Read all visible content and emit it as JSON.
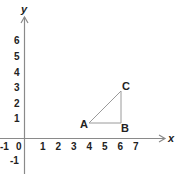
{
  "diagram": {
    "type": "coordinate-plane",
    "colors": {
      "axis": "#8a8a8a",
      "triangle": "#9a9a9a",
      "text": "#222222",
      "background": "#ffffff"
    },
    "axes": {
      "x_label": "x",
      "y_label": "y",
      "x_ticks": [
        "-1",
        "0",
        "1",
        "2",
        "3",
        "4",
        "5",
        "6",
        "7"
      ],
      "y_ticks": [
        "6",
        "5",
        "4",
        "3",
        "2",
        "1",
        "-1"
      ]
    },
    "triangle": {
      "points": [
        {
          "label": "A",
          "x": 4,
          "y": 1
        },
        {
          "label": "B",
          "x": 6,
          "y": 1
        },
        {
          "label": "C",
          "x": 6,
          "y": 3
        }
      ]
    }
  }
}
